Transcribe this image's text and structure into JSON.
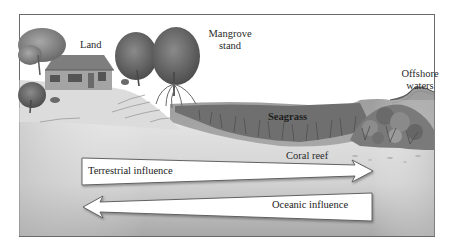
{
  "figure": {
    "type": "coastal ecosystem cross-section diagram",
    "colors": {
      "background": "#ffffff",
      "frame": "#6a6a6a",
      "seafloor_light": "#e6e6e6",
      "seafloor_dark": "#a9a9a9",
      "water": "#9a9a9a",
      "seagrass": "#6e6e6e",
      "coral": "#7d7d7d",
      "tree_canopy": "#6f6f6f",
      "arrow_fill": "#ffffff",
      "arrow_stroke": "#555555",
      "text": "#2a2a2a"
    }
  },
  "labels": {
    "land": "Land",
    "mangrove_line1": "Mangrove",
    "mangrove_line2": "stand",
    "offshore_line1": "Offshore",
    "offshore_line2": "waters",
    "seagrass": "Seagrass",
    "coral_reef": "Coral reef"
  },
  "arrows": {
    "terrestrial": {
      "label": "Terrestrial influence",
      "direction": "right"
    },
    "oceanic": {
      "label": "Oceanic influence",
      "direction": "left"
    }
  },
  "zones": [
    "Land",
    "Mangrove stand",
    "Seagrass",
    "Coral reef",
    "Offshore waters"
  ]
}
